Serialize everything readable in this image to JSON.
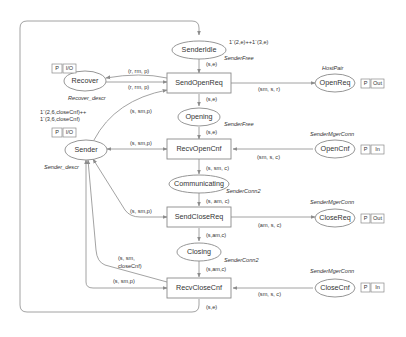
{
  "diagram": {
    "type": "Coloured Petri Net",
    "places": {
      "sender_idle": {
        "label": "SenderIdle",
        "type": "SenderFree",
        "init": "1`(2,e)++1`(3,e)"
      },
      "recover": {
        "label": "Recover",
        "type": "Recover_descr",
        "port": [
          "P",
          "I/O"
        ]
      },
      "open_req": {
        "label": "OpenReq",
        "type": "HostPair",
        "port": [
          "P",
          "Out"
        ]
      },
      "opening": {
        "label": "Opening",
        "type": "SenderFree"
      },
      "sender": {
        "label": "Sender",
        "type": "Sender_descr",
        "port": [
          "P",
          "I/O"
        ],
        "init_line1": "1`(2,6,closeCnf)++",
        "init_line2": "1`(3,6,closeCnf)"
      },
      "open_cnf": {
        "label": "OpenCnf",
        "type": "SenderMgerConn",
        "port": [
          "P",
          "In"
        ]
      },
      "communicating": {
        "label": "Communicating",
        "type": "SenderConn2"
      },
      "close_req": {
        "label": "CloseReq",
        "type": "SenderMgerConn",
        "port": [
          "P",
          "Out"
        ]
      },
      "closing": {
        "label": "Closing",
        "type": "SenderConn2"
      },
      "close_cnf": {
        "label": "CloseCnf",
        "type": "SenderMgerConn",
        "port": [
          "P",
          "In"
        ]
      }
    },
    "transitions": {
      "send_open_req": {
        "label": "SendOpenReq"
      },
      "recv_open_cnf": {
        "label": "RecvOpenCnf"
      },
      "send_close_req": {
        "label": "SendCloseReq"
      },
      "recv_close_cnf": {
        "label": "RecvCloseCnf"
      }
    },
    "arcs": {
      "idle_to_sendopen": "(s,e)",
      "recover_to_sendopen": "(r, rm, p)",
      "sendopen_to_recover": "(r, rm, p)",
      "sender_to_sendopen": "(s, sm,p)",
      "sendopen_to_openreq": "(sm, s, r)",
      "sendopen_to_opening": "(s,e)",
      "opening_to_recvopen": "(s,e)",
      "sender_recvopen": "(s, sm,p)",
      "opencnf_to_recvopen": "(sm, s, c)",
      "recvopen_to_comm": "(s, sm, c)",
      "comm_to_sendclose": "(s, am, c)",
      "sender_sendclose": "(s, sm,p)",
      "sendclose_to_closereq": "(am, s, c)",
      "sendclose_to_closing": "(s,am,c)",
      "closing_to_recvclose": "(s,am,c)",
      "recvclose_to_sender_l1": "(s, sm,",
      "recvclose_to_sender_l2": "closeCnf)",
      "sender_to_recvclose": "(s, sm,p)",
      "closecnf_to_recvclose": "(sm, s, c)",
      "recvclose_to_idle": "(s,e)"
    }
  }
}
